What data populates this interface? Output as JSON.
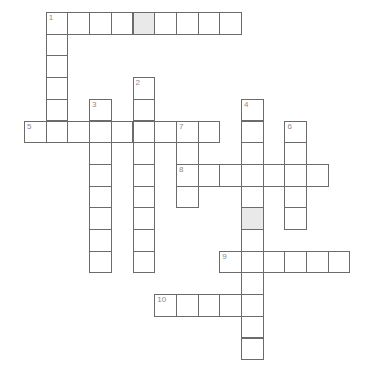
{
  "puzzle": {
    "cell_size": 21.7,
    "origin_x": 24,
    "origin_y": 12,
    "colors": {
      "line": "#6b6b6b",
      "shaded": "#e9e9e9",
      "number": "#8a8a8a"
    },
    "entries": [
      {
        "number": "1",
        "direction": "across",
        "row": 0,
        "col": 1,
        "length": 9
      },
      {
        "number": "1",
        "direction": "down",
        "row": 0,
        "col": 1,
        "length": 6
      },
      {
        "number": "2",
        "direction": "down",
        "row": 3,
        "col": 5,
        "length": 9
      },
      {
        "number": "3",
        "direction": "down",
        "row": 4,
        "col": 3,
        "length": 8
      },
      {
        "number": "4",
        "direction": "down",
        "row": 4,
        "col": 10,
        "length": 12
      },
      {
        "number": "5",
        "direction": "across",
        "row": 5,
        "col": 0,
        "length": 9
      },
      {
        "number": "6",
        "direction": "down",
        "row": 5,
        "col": 12,
        "length": 5
      },
      {
        "number": "7",
        "direction": "down",
        "row": 5,
        "col": 7,
        "length": 4
      },
      {
        "number": "8",
        "direction": "across",
        "row": 7,
        "col": 7,
        "length": 7
      },
      {
        "number": "9",
        "direction": "across",
        "row": 11,
        "col": 9,
        "length": 6
      },
      {
        "number": "10",
        "direction": "across",
        "row": 13,
        "col": 6,
        "length": 5
      }
    ],
    "shaded_cells": [
      {
        "row": 0,
        "col": 5
      },
      {
        "row": 9,
        "col": 10
      }
    ]
  }
}
